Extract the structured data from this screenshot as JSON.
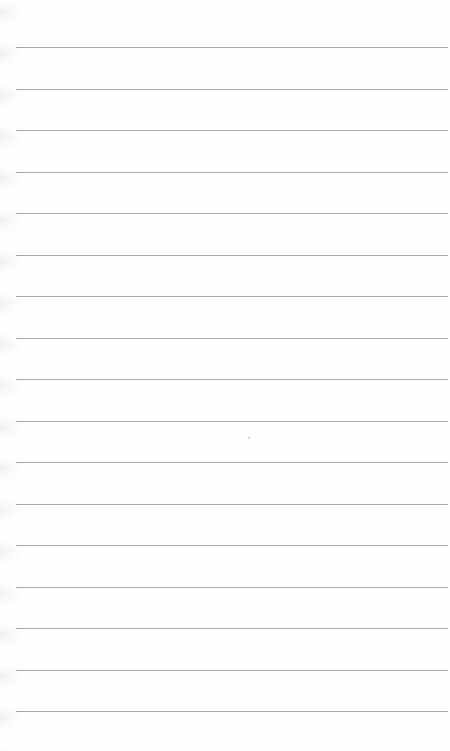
{
  "page": {
    "type": "blank ruled notepad paper",
    "background_color": "#fefefe",
    "line_color": "#a8a8a8",
    "line_count": 17,
    "first_line_y": 47,
    "line_spacing_px": 41.5,
    "text": ""
  }
}
